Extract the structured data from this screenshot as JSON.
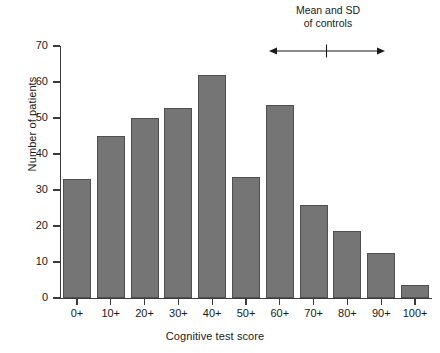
{
  "chart_data": {
    "type": "bar",
    "title": "",
    "xlabel": "Cognitive test score",
    "ylabel": "Number of patients",
    "categories": [
      "0+",
      "10+",
      "20+",
      "30+",
      "40+",
      "50+",
      "60+",
      "70+",
      "80+",
      "90+",
      "100+"
    ],
    "values": [
      33,
      45,
      50,
      52.7,
      62,
      33.7,
      53.7,
      25.7,
      18.7,
      12.5,
      3.5
    ],
    "ylim": [
      0,
      70
    ],
    "yticks": [
      0,
      10,
      20,
      30,
      40,
      50,
      60,
      70
    ],
    "ytick_labels": [
      "0",
      "10",
      "20",
      "30",
      "40",
      "50",
      "60",
      "70"
    ],
    "grid": false,
    "legend": false,
    "bar_color": "#757575",
    "bar_edge_color": "#4f4f4f",
    "axis_color": "#3c3c3c",
    "annotations": [
      {
        "name": "mean-sd-of-controls",
        "line1": "Mean and SD",
        "line2": "of controls",
        "marker": "double-headed-arrow-with-center-tick",
        "span_start_category": "70+",
        "span_end_category": "100+"
      }
    ]
  }
}
